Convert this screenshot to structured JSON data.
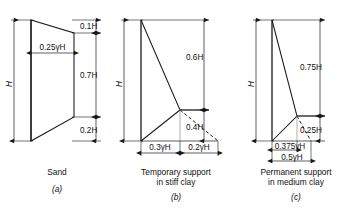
{
  "figure": {
    "stroke_color": "#1a1a1a",
    "background_color": "#ffffff"
  },
  "panels": [
    {
      "id": "a",
      "letter": "(a)",
      "caption_lines": [
        "Sand"
      ],
      "soil": "Sand",
      "shape": "trapezoid",
      "pressure_label": "0.25γH",
      "depth_labels": [
        "0.1H",
        "0.7H",
        "0.2H"
      ],
      "height_label": "H",
      "segments": [
        {
          "label": "0.1H",
          "fraction": 0.1
        },
        {
          "label": "0.7H",
          "fraction": 0.7
        },
        {
          "label": "0.2H",
          "fraction": 0.2
        }
      ]
    },
    {
      "id": "b",
      "letter": "(b)",
      "caption_lines": [
        "Temporary support",
        "in stiff clay"
      ],
      "soil": "Stiff clay",
      "shape": "triangle-with-dashed-extension",
      "height_label": "H",
      "depth_labels": [
        "0.6H",
        "0.4H"
      ],
      "width_labels": [
        "0.3γH",
        "0.2γH"
      ],
      "segments": [
        {
          "label": "0.6H",
          "fraction": 0.6
        },
        {
          "label": "0.4H",
          "fraction": 0.4
        }
      ],
      "widths": [
        {
          "label": "0.3γH",
          "fraction": 0.3
        },
        {
          "label": "0.2γH",
          "fraction": 0.2
        }
      ]
    },
    {
      "id": "c",
      "letter": "(c)",
      "caption_lines": [
        "Permanent support",
        "in medium clay"
      ],
      "soil": "Medium clay",
      "shape": "triangle-with-dashed-extension",
      "height_label": "H",
      "depth_labels": [
        "0.75H",
        "0.25H"
      ],
      "width_labels": [
        "0.375γH",
        "0.5γH"
      ],
      "segments": [
        {
          "label": "0.75H",
          "fraction": 0.75
        },
        {
          "label": "0.25H",
          "fraction": 0.25
        }
      ],
      "widths": [
        {
          "label": "0.375γH",
          "fraction": 0.375
        },
        {
          "label": "0.5γH",
          "fraction": 0.5
        }
      ]
    }
  ]
}
